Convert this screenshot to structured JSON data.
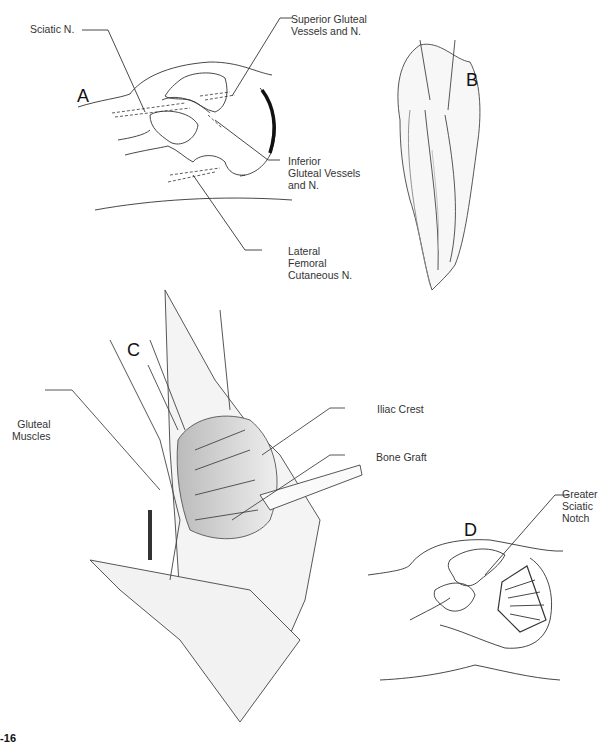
{
  "figure": {
    "number_fragment": "8-16",
    "panels": [
      {
        "id": "A",
        "letter": "A",
        "labels": [
          {
            "key": "sciatic",
            "text": "Sciatic N."
          },
          {
            "key": "superior",
            "text": "Superior Gluteal\nVessels and N."
          },
          {
            "key": "inferior",
            "text": "Inferior\nGluteal Vessels\nand N."
          },
          {
            "key": "lateral",
            "text": "Lateral\nFemoral\nCutaneous N."
          }
        ]
      },
      {
        "id": "B",
        "letter": "B",
        "labels": []
      },
      {
        "id": "C",
        "letter": "C",
        "labels": [
          {
            "key": "gluteal",
            "text": "Gluteal\nMuscles"
          },
          {
            "key": "iliac",
            "text": "Iliac Crest"
          },
          {
            "key": "graft",
            "text": "Bone Graft"
          }
        ]
      },
      {
        "id": "D",
        "letter": "D",
        "labels": [
          {
            "key": "notch",
            "text": "Greater\nSciatic\nNotch"
          }
        ]
      }
    ]
  },
  "colors": {
    "line": "#333333",
    "shade": "#9a9a9a",
    "background": "#ffffff"
  }
}
